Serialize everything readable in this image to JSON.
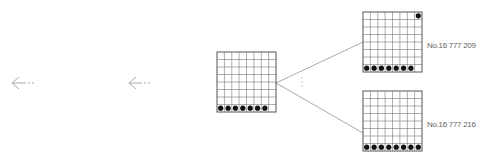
{
  "diagram": {
    "arrows": [
      {
        "name": "left-arrow-1",
        "glyph": "←···"
      },
      {
        "name": "left-arrow-2",
        "glyph": "←···"
      }
    ],
    "boards": [
      {
        "id": "center",
        "size": 8,
        "dots": "bottom row 7 of 8",
        "label": ""
      },
      {
        "id": "top-right",
        "size": 8,
        "dots": "bottom row 7 of 8 + top-right corner",
        "label": "No.16 777 209"
      },
      {
        "id": "bottom-right",
        "size": 8,
        "dots": "bottom row 8 of 8",
        "label": "No.16 777 216"
      }
    ],
    "ellipsis": "⋮",
    "colors": {
      "grid_line": "#555555",
      "dot": "#111111",
      "connector": "#aaaaaa",
      "text": "#666666"
    }
  }
}
